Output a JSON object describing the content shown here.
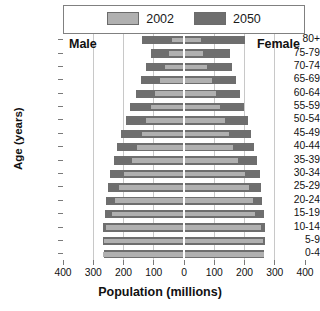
{
  "chart_data": {
    "type": "bar",
    "subtype": "population-pyramid",
    "title": "",
    "xlabel": "Population (millions)",
    "ylabel": "Age (years)",
    "xlim": [
      -400,
      400
    ],
    "xticks": [
      400,
      300,
      200,
      100,
      0,
      100,
      200,
      300,
      400
    ],
    "grid": true,
    "legend_position": "top",
    "side_labels": {
      "left": "Male",
      "right": "Female"
    },
    "categories": [
      "80+",
      "75-79",
      "70-74",
      "65-69",
      "60-64",
      "55-59",
      "50-54",
      "45-49",
      "40-44",
      "35-39",
      "30-34",
      "25-29",
      "20-24",
      "15-19",
      "10-14",
      "5-9",
      "0-4"
    ],
    "legend": [
      {
        "name": "2002",
        "color": "#b0b0b0"
      },
      {
        "name": "2050",
        "color": "#6e6e6e"
      }
    ],
    "series": [
      {
        "name": "2002",
        "color": "#b0b0b0",
        "male": [
          40,
          48,
          62,
          80,
          95,
          110,
          126,
          140,
          155,
          172,
          200,
          215,
          228,
          238,
          258,
          265,
          268
        ],
        "female": [
          55,
          62,
          76,
          92,
          105,
          120,
          134,
          148,
          162,
          178,
          203,
          216,
          227,
          236,
          254,
          261,
          263
        ]
      },
      {
        "name": "2050",
        "color": "#6e6e6e",
        "male": [
          140,
          110,
          125,
          142,
          160,
          178,
          192,
          208,
          222,
          232,
          245,
          252,
          258,
          262,
          268,
          268,
          266
        ],
        "female": [
          200,
          152,
          160,
          172,
          185,
          198,
          210,
          222,
          232,
          240,
          250,
          255,
          259,
          263,
          268,
          268,
          265
        ]
      }
    ]
  },
  "legend": {
    "entries": [
      {
        "label": "2002"
      },
      {
        "label": "2050"
      }
    ]
  },
  "axes": {
    "x_title": "Population (millions)",
    "y_title": "Age (years)",
    "x_ticks": [
      "400",
      "300",
      "200",
      "100",
      "0",
      "100",
      "200",
      "300",
      "400"
    ],
    "y_ticks": [
      "80+",
      "75-79",
      "70-74",
      "65-69",
      "60-64",
      "55-59",
      "50-54",
      "45-49",
      "40-44",
      "35-39",
      "30-34",
      "25-29",
      "20-24",
      "15-19",
      "10-14",
      "5-9",
      "0-4"
    ]
  },
  "annotations": {
    "male": "Male",
    "female": "Female"
  }
}
